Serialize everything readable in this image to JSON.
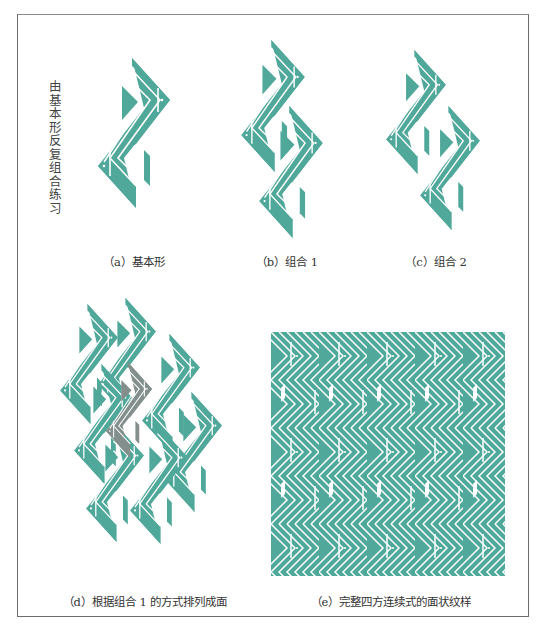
{
  "figure": {
    "side_title": "由基本形反复组合练习",
    "colors": {
      "motif": "#4fa89a",
      "highlight": "#838f8c",
      "stripe": "#ffffff",
      "frame": "#6b6b6b"
    },
    "panels": [
      {
        "id": "a",
        "caption": "（a）基本形"
      },
      {
        "id": "b",
        "caption": "（b）组合 1"
      },
      {
        "id": "c",
        "caption": "（c）组合 2"
      },
      {
        "id": "d",
        "caption": "（d）根据组合 1 的方式排列成面"
      },
      {
        "id": "e",
        "caption": "（e）完整四方连续式的面状纹样"
      }
    ]
  }
}
